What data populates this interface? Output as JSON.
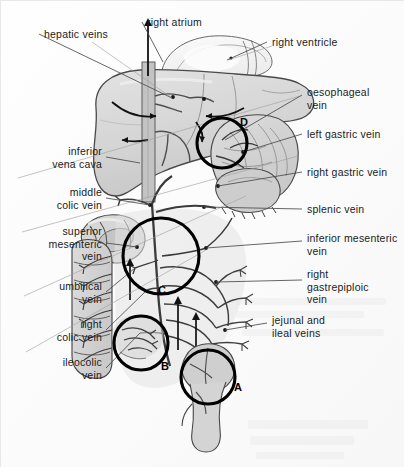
{
  "figure": {
    "background_color": "#fdfdfd",
    "width": 404,
    "height": 467
  },
  "labels": [
    {
      "id": "hepatic-veins",
      "text": "hepatic veins",
      "align": "left",
      "x": 44,
      "y": 28,
      "leader_to": [
        172,
        98
      ]
    },
    {
      "id": "right-atrium",
      "text": "right atrium",
      "align": "left",
      "x": 147,
      "y": 16,
      "leader_to": [
        163,
        62
      ]
    },
    {
      "id": "right-ventricle",
      "text": "right ventricle",
      "align": "left",
      "x": 272,
      "y": 36,
      "leader_to": [
        227,
        60
      ]
    },
    {
      "id": "oesophageal-vein",
      "text": "oesophageal\nvein",
      "align": "left",
      "x": 307,
      "y": 86,
      "leader_to": [
        225,
        140
      ]
    },
    {
      "id": "left-gastric-vein",
      "text": "left gastric vein",
      "align": "left",
      "x": 307,
      "y": 128,
      "leader_to": [
        243,
        152
      ]
    },
    {
      "id": "right-gastric-vein",
      "text": "right gastric vein",
      "align": "left",
      "x": 307,
      "y": 166,
      "leader_to": [
        218,
        186
      ]
    },
    {
      "id": "splenic-vein",
      "text": "splenic vein",
      "align": "left",
      "x": 307,
      "y": 203,
      "leader_to": [
        204,
        207
      ]
    },
    {
      "id": "inferior-mesenteric-vein",
      "text": "inferior mesenteric\nvein",
      "align": "left",
      "x": 307,
      "y": 232,
      "leader_to": [
        206,
        248
      ]
    },
    {
      "id": "right-gastrepiploic-vein",
      "text": "right\ngastrepiploic\nvein",
      "align": "left",
      "x": 307,
      "y": 268,
      "leader_to": [
        216,
        282
      ]
    },
    {
      "id": "jejunal-and-ileal-veins",
      "text": "jejunal and\nileal veins",
      "align": "left",
      "x": 272,
      "y": 314,
      "leader_to": [
        225,
        330
      ]
    },
    {
      "id": "inferior-vena-cava",
      "text": "inferior\nvena cava",
      "align": "right",
      "x": 18,
      "y": 145,
      "leader_to": [
        140,
        163
      ]
    },
    {
      "id": "middle-colic-vein",
      "text": "middle\ncolic vein",
      "align": "right",
      "x": 18,
      "y": 186,
      "leader_to": [
        150,
        205
      ]
    },
    {
      "id": "superior-mesenteric-vein",
      "text": "superior\nmesenteric\nvein",
      "align": "right",
      "x": 18,
      "y": 225,
      "leader_to": [
        137,
        247
      ]
    },
    {
      "id": "umbilical-vein",
      "text": "umbilical\nvein",
      "align": "right",
      "x": 18,
      "y": 280,
      "leader_to": [
        135,
        268
      ]
    },
    {
      "id": "right-colic-vein",
      "text": "right\ncolic vein",
      "align": "right",
      "x": 18,
      "y": 318,
      "leader_to": [
        147,
        290
      ]
    },
    {
      "id": "ileocolic-vein",
      "text": "ileocolic\nvein",
      "align": "right",
      "x": 18,
      "y": 356,
      "leader_to": [
        140,
        333
      ]
    }
  ],
  "circle_markers": [
    {
      "letter": "A",
      "cx": 208,
      "cy": 377,
      "r": 27,
      "label_x": 234,
      "label_y": 381
    },
    {
      "letter": "B",
      "cx": 141,
      "cy": 343,
      "r": 27,
      "label_x": 161,
      "label_y": 360
    },
    {
      "letter": "C",
      "cx": 161,
      "cy": 256,
      "r": 38,
      "label_x": 158,
      "label_y": 284
    },
    {
      "letter": "D",
      "cx": 222,
      "cy": 143,
      "r": 25,
      "label_x": 240,
      "label_y": 116
    }
  ],
  "palette": {
    "organ_fill_light": "#dedede",
    "organ_fill_mid": "#cfcfcf",
    "organ_fill_dark": "#bdbdbd",
    "vessel_fill": "#b8b8b8",
    "outline": "#3a3a3a",
    "leader_line": "#4a4a4a",
    "marker_circle": "#000000",
    "highlight": "#f4f4f4",
    "background": "#fdfdfd"
  }
}
